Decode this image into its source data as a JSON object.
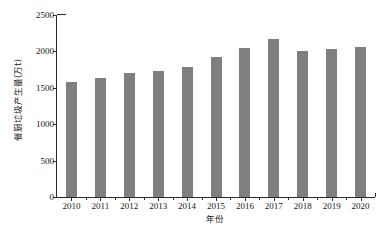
{
  "chart_data": {
    "type": "bar",
    "title": "",
    "subtitle": "",
    "xlabel": "年份",
    "ylabel": "餐厨垃圾产生量(万t)",
    "categories": [
      "2010",
      "2011",
      "2012",
      "2013",
      "2014",
      "2015",
      "2016",
      "2017",
      "2018",
      "2019",
      "2020"
    ],
    "values": [
      1575,
      1640,
      1710,
      1725,
      1790,
      1920,
      2045,
      2165,
      2010,
      2035,
      2065
    ],
    "series": [
      {
        "name": "餐厨垃圾产生量",
        "values": [
          1575,
          1640,
          1710,
          1725,
          1790,
          1920,
          2045,
          2165,
          2010,
          2035,
          2065
        ]
      }
    ],
    "ylim": [
      0,
      2500
    ],
    "yticks": [
      0,
      500,
      1000,
      1500,
      2000,
      2500
    ],
    "ytick_labels": [
      "0",
      "500",
      "1000",
      "1500",
      "2000",
      "2500"
    ],
    "grid": false,
    "legend": null,
    "bar_color": "#7f7f7f",
    "axis_color": "#2b2b2b",
    "background": "#ffffff",
    "annotations": []
  }
}
